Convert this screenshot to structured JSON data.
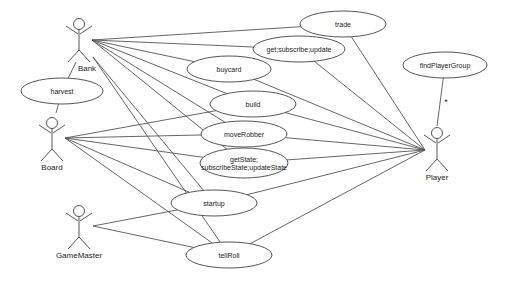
{
  "diagram": {
    "type": "uml-use-case",
    "actors": [
      {
        "id": "bank",
        "label": "Bank"
      },
      {
        "id": "board",
        "label": "Board"
      },
      {
        "id": "player",
        "label": "Player"
      },
      {
        "id": "gamemaster",
        "label": "GameMaster"
      }
    ],
    "use_cases": [
      {
        "id": "trade",
        "lines": [
          "trade"
        ]
      },
      {
        "id": "getsub",
        "lines": [
          "get;subscribe;update"
        ]
      },
      {
        "id": "buycard",
        "lines": [
          "buycard"
        ]
      },
      {
        "id": "build",
        "lines": [
          "build"
        ]
      },
      {
        "id": "moverobber",
        "lines": [
          "moveRobber"
        ]
      },
      {
        "id": "getstate",
        "lines": [
          "getState;",
          "subscribeState;updateState"
        ]
      },
      {
        "id": "startup",
        "lines": [
          "startup"
        ]
      },
      {
        "id": "tellroll",
        "lines": [
          "tellRoll"
        ]
      },
      {
        "id": "harvest",
        "lines": [
          "harvest"
        ]
      },
      {
        "id": "findplayergroup",
        "lines": [
          "findPlayerGroup"
        ]
      }
    ],
    "associations": [
      {
        "from": "bank",
        "to": "trade"
      },
      {
        "from": "bank",
        "to": "getsub"
      },
      {
        "from": "bank",
        "to": "buycard"
      },
      {
        "from": "bank",
        "to": "build"
      },
      {
        "from": "bank",
        "to": "moverobber"
      },
      {
        "from": "bank",
        "to": "getstate"
      },
      {
        "from": "bank",
        "to": "startup"
      },
      {
        "from": "bank",
        "to": "tellroll"
      },
      {
        "from": "bank",
        "to": "harvest"
      },
      {
        "from": "board",
        "to": "harvest"
      },
      {
        "from": "board",
        "to": "build"
      },
      {
        "from": "board",
        "to": "moverobber"
      },
      {
        "from": "board",
        "to": "getstate"
      },
      {
        "from": "board",
        "to": "startup"
      },
      {
        "from": "board",
        "to": "tellroll"
      },
      {
        "from": "gamemaster",
        "to": "startup"
      },
      {
        "from": "gamemaster",
        "to": "tellroll"
      },
      {
        "from": "player",
        "to": "trade"
      },
      {
        "from": "player",
        "to": "getsub"
      },
      {
        "from": "player",
        "to": "buycard"
      },
      {
        "from": "player",
        "to": "build"
      },
      {
        "from": "player",
        "to": "moverobber"
      },
      {
        "from": "player",
        "to": "getstate"
      },
      {
        "from": "player",
        "to": "startup"
      },
      {
        "from": "player",
        "to": "tellroll"
      },
      {
        "from": "player",
        "to": "findplayergroup",
        "multiplicity": "*"
      }
    ]
  }
}
